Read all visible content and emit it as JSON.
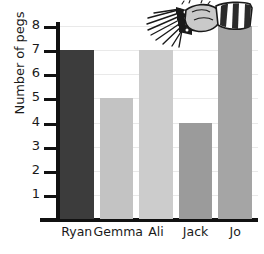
{
  "chart_data": {
    "type": "bar",
    "title": "",
    "xlabel": "",
    "ylabel": "Number of pegs",
    "categories": [
      "Ryan",
      "Gemma",
      "Ali",
      "Jack",
      "Jo"
    ],
    "values": [
      7,
      5,
      7,
      4,
      8
    ],
    "ylim": [
      0,
      8
    ],
    "ytick_labels": [
      "1",
      "2",
      "3",
      "4",
      "5",
      "6",
      "7",
      "8"
    ],
    "ytick_values": [
      1,
      2,
      3,
      4,
      5,
      6,
      7,
      8
    ],
    "grid": true,
    "legend": "none",
    "bar_colors": [
      "#3c3c3c",
      "#c3c3c3",
      "#cccccc",
      "#9b9b9b",
      "#a5a5a5"
    ],
    "axis_color": "#111111",
    "gridline_color": "#e9e9e9",
    "background_color": "#ffffff"
  },
  "decoration": {
    "clipart_name": "hand-holding-clothes-pegs",
    "clipart_colors": {
      "skin": "#c9c9c9",
      "outline": "#1a1a1a",
      "sleeve_light": "#ffffff",
      "sleeve_dark": "#2b2b2b",
      "peg_dark": "#111111"
    }
  }
}
